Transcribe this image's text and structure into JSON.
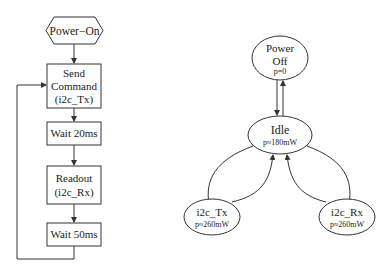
{
  "flowchart": {
    "start": "Power−On",
    "steps": [
      {
        "line1": "Send",
        "line2": "Command",
        "line3": "(i2c_Tx)"
      },
      {
        "line1": "Wait 20ms"
      },
      {
        "line1": "Readout",
        "line2": "(i2c_Rx)"
      },
      {
        "line1": "Wait 50ms"
      }
    ]
  },
  "state_diagram": {
    "power_off": {
      "line1": "Power",
      "line2": "Off",
      "power": "p=0"
    },
    "idle": {
      "label": "Idle",
      "power": "p≈180mW"
    },
    "i2c_tx": {
      "label": "i2c_Tx",
      "power": "p≈260mW"
    },
    "i2c_rx": {
      "label": "i2c_Rx",
      "power": "p≈260mW"
    }
  },
  "colors": {
    "stroke": "#333333",
    "text": "#222222"
  }
}
